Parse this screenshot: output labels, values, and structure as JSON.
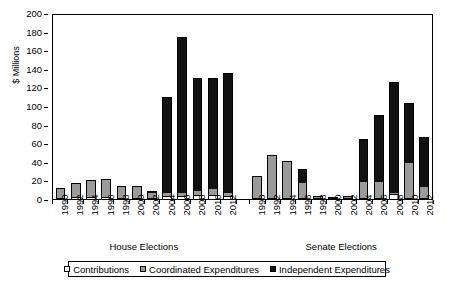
{
  "chart_data": {
    "type": "bar",
    "stacked": true,
    "title": "",
    "xlabel": "",
    "ylabel": "$ Millions",
    "ylim": [
      0,
      200
    ],
    "yticks": [
      0,
      20,
      40,
      60,
      80,
      100,
      120,
      140,
      160,
      180,
      200
    ],
    "grid": false,
    "legend_position": "bottom",
    "groups": [
      "House Elections",
      "Senate Elections"
    ],
    "categories": [
      "1990",
      "1992",
      "1994",
      "1996",
      "1998",
      "2000",
      "2002",
      "2004",
      "2006",
      "2008",
      "2010",
      "2012"
    ],
    "series": [
      {
        "name": "Contributions",
        "color": "#ffffff"
      },
      {
        "name": "Coordinated Expenditures",
        "color": "#9a9a9a"
      },
      {
        "name": "Independent Expenditures",
        "color": "#111111"
      }
    ],
    "data": {
      "House Elections": {
        "Contributions": [
          1.5,
          2.0,
          2.0,
          2.5,
          1.5,
          1.5,
          1.0,
          3.0,
          3.0,
          4.0,
          4.0,
          3.0
        ],
        "Coordinated Expenditures": [
          10.5,
          15.5,
          18.5,
          19.5,
          11.0,
          11.0,
          5.5,
          4.0,
          3.0,
          5.0,
          7.0,
          3.0
        ],
        "Independent Expenditures": [
          0.0,
          0.0,
          0.0,
          0.0,
          0.5,
          2.0,
          1.5,
          103.0,
          168.0,
          121.0,
          119.0,
          129.0
        ]
      },
      "Senate Elections": {
        "Contributions": [
          0.5,
          0.5,
          0.5,
          0.5,
          0.3,
          0.3,
          0.3,
          0.5,
          0.5,
          5.0,
          1.0,
          0.5
        ],
        "Coordinated Expenditures": [
          23.5,
          46.5,
          39.5,
          15.5,
          1.7,
          0.7,
          1.7,
          17.5,
          16.5,
          2.0,
          37.0,
          11.5
        ],
        "Independent Expenditures": [
          0.0,
          0.0,
          0.0,
          15.0,
          0.0,
          0.0,
          0.0,
          46.0,
          73.0,
          119.0,
          65.0,
          54.0
        ]
      }
    },
    "totals": {
      "House Elections": [
        12,
        17.5,
        20.5,
        22,
        13,
        14.5,
        8,
        110,
        174,
        130,
        130,
        135
      ],
      "Senate Elections": [
        24,
        47,
        40,
        31.5,
        2,
        1,
        2,
        64,
        90,
        126,
        103,
        66
      ]
    }
  },
  "axis": {
    "y_title": "$ Millions",
    "y_tick_labels": [
      "200",
      "180",
      "160",
      "140",
      "120",
      "100",
      "80",
      "60",
      "40",
      "20",
      "0"
    ]
  },
  "group_labels": {
    "house": "House Elections",
    "senate": "Senate Elections"
  },
  "legend": {
    "items": [
      {
        "label": "Contributions",
        "swatch": "white-square-icon"
      },
      {
        "label": "Coordinated Expenditures",
        "swatch": "gray-square-icon"
      },
      {
        "label": "Independent Expenditures",
        "swatch": "black-square-icon"
      }
    ]
  }
}
